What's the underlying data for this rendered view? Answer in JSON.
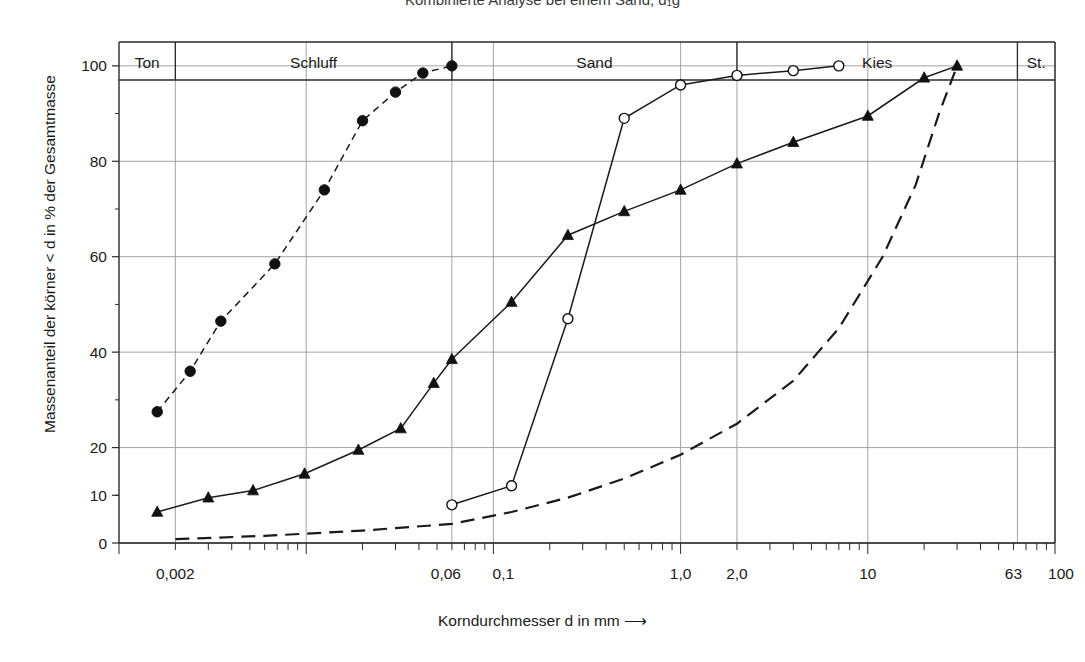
{
  "title": "Kombinierte Analyse bei einem Sand, d₁g",
  "axes": {
    "ylabel": "Massenanteil der körner < d in % der Gesamtmasse",
    "xlabel": "Korndurchmesser d in mm ⟶",
    "xlabel_text": "Korndurchmesser d in mm",
    "arrow": "⟶",
    "y_ticks": [
      "0",
      "10",
      "20",
      "40",
      "60",
      "80",
      "100"
    ],
    "y_tick_values": [
      0,
      10,
      20,
      40,
      60,
      80,
      100
    ],
    "x_tick_labels": [
      "0,002",
      "0,06",
      "0,1",
      "1,0",
      "2,0",
      "10",
      "63",
      "100"
    ],
    "x_tick_values": [
      0.002,
      0.06,
      0.1,
      1.0,
      2.0,
      10,
      63,
      100
    ],
    "xlim": [
      0.001,
      100
    ],
    "ylim": [
      0,
      105
    ],
    "scale": "log-x",
    "grid": true
  },
  "categories": [
    {
      "label": "Ton",
      "from": 0.001,
      "to": 0.002
    },
    {
      "label": "Schluff",
      "from": 0.002,
      "to": 0.06
    },
    {
      "label": "Sand",
      "from": 0.06,
      "to": 2.0
    },
    {
      "label": "Kies",
      "from": 2.0,
      "to": 63
    },
    {
      "label": "St.",
      "from": 63,
      "to": 100
    }
  ],
  "chart_data": {
    "type": "line",
    "title": "Kombinierte Analyse bei einem Sand, d₁g",
    "xlabel": "Korndurchmesser d in mm",
    "ylabel": "Massenanteil der körner < d in % der Gesamtmasse",
    "xscale": "log",
    "xlim": [
      0.001,
      100
    ],
    "ylim": [
      0,
      105
    ],
    "grid": true,
    "legend": "none",
    "series": [
      {
        "name": "Schlammanalyse (gefüllte Kreise, gestrichelt)",
        "marker": "filled-circle",
        "linestyle": "dashed",
        "points": [
          [
            0.0016,
            27.5
          ],
          [
            0.0024,
            36.0
          ],
          [
            0.0035,
            46.5
          ],
          [
            0.0068,
            58.5
          ],
          [
            0.0125,
            74.0
          ],
          [
            0.02,
            88.5
          ],
          [
            0.03,
            94.5
          ],
          [
            0.042,
            98.5
          ],
          [
            0.06,
            100.0
          ]
        ]
      },
      {
        "name": "Siebanalyse grob (gefüllte Dreiecke, durchgezogen)",
        "marker": "filled-triangle",
        "linestyle": "solid",
        "points": [
          [
            0.0016,
            6.5
          ],
          [
            0.003,
            9.5
          ],
          [
            0.0052,
            11.0
          ],
          [
            0.0098,
            14.5
          ],
          [
            0.019,
            19.5
          ],
          [
            0.032,
            24.0
          ],
          [
            0.048,
            33.5
          ],
          [
            0.06,
            38.5
          ],
          [
            0.125,
            50.5
          ],
          [
            0.25,
            64.5
          ],
          [
            0.5,
            69.5
          ],
          [
            1.0,
            74.0
          ],
          [
            2.0,
            79.5
          ],
          [
            4.0,
            84.0
          ],
          [
            10.0,
            89.5
          ],
          [
            20.0,
            97.5
          ],
          [
            30.0,
            100.0
          ]
        ]
      },
      {
        "name": "Kombinierte Analyse (offene Kreise, durchgezogen)",
        "marker": "open-circle",
        "linestyle": "solid",
        "points": [
          [
            0.06,
            8.0
          ],
          [
            0.125,
            12.0
          ],
          [
            0.25,
            47.0
          ],
          [
            0.5,
            89.0
          ],
          [
            1.0,
            96.0
          ],
          [
            2.0,
            98.0
          ],
          [
            4.0,
            99.0
          ],
          [
            7.0,
            100.0
          ]
        ]
      },
      {
        "name": "Summenkurve ohne Marker (lang gestrichelt)",
        "marker": "none",
        "linestyle": "long-dashed",
        "points": [
          [
            0.002,
            0.8
          ],
          [
            0.006,
            1.5
          ],
          [
            0.02,
            2.6
          ],
          [
            0.06,
            4.0
          ],
          [
            0.125,
            6.5
          ],
          [
            0.25,
            9.5
          ],
          [
            0.5,
            13.5
          ],
          [
            1.0,
            18.5
          ],
          [
            2.0,
            25.0
          ],
          [
            4.0,
            34.0
          ],
          [
            7.0,
            45.0
          ],
          [
            12.0,
            60.0
          ],
          [
            18.0,
            75.0
          ],
          [
            24.0,
            90.0
          ],
          [
            30.0,
            100.0
          ]
        ]
      }
    ]
  }
}
